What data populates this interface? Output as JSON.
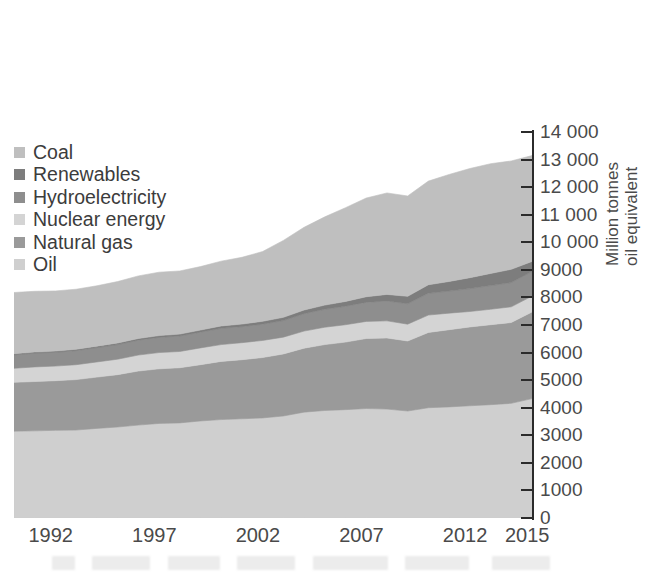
{
  "chart_data": {
    "type": "area",
    "stacked": true,
    "title": "",
    "subtitle": "",
    "xlabel": "",
    "ylabel": "Million tonnes\noil equivalent",
    "ylim": [
      0,
      14000
    ],
    "ytick_step": 1000,
    "grid": false,
    "legend_position": "top-left",
    "y_tick_labels": [
      "14 000",
      "13 000",
      "12 000",
      "11 000",
      "10 000",
      "9000",
      "8000",
      "7000",
      "6000",
      "5000",
      "4000",
      "3000",
      "2000",
      "1000",
      "0"
    ],
    "y_tick_values": [
      14000,
      13000,
      12000,
      11000,
      10000,
      9000,
      8000,
      7000,
      6000,
      5000,
      4000,
      3000,
      2000,
      1000,
      0
    ],
    "x_tick_labels": [
      "1992",
      "1997",
      "2002",
      "2007",
      "2012",
      "2015"
    ],
    "x_tick_values": [
      1992,
      1997,
      2002,
      2007,
      2012,
      2015
    ],
    "xlim": [
      1990,
      2015
    ],
    "x": [
      1990,
      1991,
      1992,
      1993,
      1994,
      1995,
      1996,
      1997,
      1998,
      1999,
      2000,
      2001,
      2002,
      2003,
      2004,
      2005,
      2006,
      2007,
      2008,
      2009,
      2010,
      2011,
      2012,
      2013,
      2014,
      2015
    ],
    "series": [
      {
        "name": "Oil",
        "color": "#cfcfcf",
        "values": [
          3150,
          3160,
          3180,
          3190,
          3250,
          3300,
          3370,
          3430,
          3450,
          3520,
          3570,
          3600,
          3630,
          3700,
          3840,
          3900,
          3930,
          3970,
          3950,
          3880,
          4000,
          4030,
          4070,
          4110,
          4160,
          4330
        ]
      },
      {
        "name": "Natural gas",
        "color": "#9a9a9a",
        "values": [
          1770,
          1790,
          1800,
          1830,
          1860,
          1900,
          1960,
          1980,
          2000,
          2040,
          2110,
          2140,
          2190,
          2250,
          2320,
          2390,
          2450,
          2540,
          2580,
          2540,
          2730,
          2800,
          2860,
          2900,
          2930,
          3140
        ]
      },
      {
        "name": "Nuclear energy",
        "color": "#d4d4d4",
        "values": [
          510,
          530,
          530,
          540,
          550,
          560,
          580,
          590,
          590,
          610,
          610,
          620,
          620,
          610,
          620,
          630,
          630,
          620,
          620,
          610,
          630,
          600,
          560,
          560,
          570,
          580
        ]
      },
      {
        "name": "Hydroelectricity",
        "color": "#8e8e8e",
        "values": [
          490,
          500,
          500,
          510,
          520,
          530,
          540,
          550,
          560,
          570,
          590,
          580,
          590,
          600,
          630,
          650,
          670,
          690,
          720,
          740,
          790,
          800,
          830,
          860,
          880,
          890
        ]
      },
      {
        "name": "Renewables",
        "color": "#7d7d7d",
        "values": [
          40,
          42,
          45,
          48,
          52,
          56,
          60,
          65,
          70,
          78,
          86,
          94,
          105,
          118,
          134,
          152,
          175,
          205,
          240,
          270,
          310,
          350,
          395,
          440,
          480,
          365
        ]
      },
      {
        "name": "Coal",
        "color": "#bfbfbf",
        "values": [
          2220,
          2200,
          2180,
          2180,
          2190,
          2230,
          2270,
          2300,
          2290,
          2300,
          2350,
          2420,
          2530,
          2790,
          3000,
          3200,
          3400,
          3580,
          3680,
          3640,
          3760,
          3880,
          3960,
          3980,
          3930,
          3840
        ]
      }
    ],
    "legend_order_top_to_bottom": [
      "Coal",
      "Renewables",
      "Hydroelectricity",
      "Nuclear energy",
      "Natural gas",
      "Oil"
    ],
    "stack_order_bottom_to_top": [
      "Oil",
      "Natural gas",
      "Nuclear energy",
      "Hydroelectricity",
      "Renewables",
      "Coal"
    ]
  },
  "legend": {
    "items": [
      {
        "label": "Coal",
        "color": "#bfbfbf"
      },
      {
        "label": "Renewables",
        "color": "#7d7d7d"
      },
      {
        "label": "Hydroelectricity",
        "color": "#8e8e8e"
      },
      {
        "label": "Nuclear energy",
        "color": "#d4d4d4"
      },
      {
        "label": "Natural gas",
        "color": "#9a9a9a"
      },
      {
        "label": "Oil",
        "color": "#cfcfcf"
      }
    ]
  },
  "axis": {
    "y_title": "Million tonnes\noil equivalent",
    "axis_color": "#2b2b2b",
    "label_color": "#4a4a4a"
  }
}
